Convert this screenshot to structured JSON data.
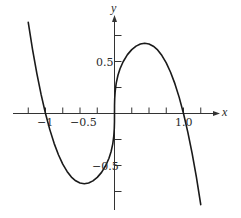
{
  "chart_data": {
    "type": "line",
    "title": "",
    "function": "y = x^(1/3) - x^3",
    "xlabel": "x",
    "ylabel": "y",
    "xlim": [
      -1.25,
      1.25
    ],
    "ylim": [
      -0.9,
      0.9
    ],
    "grid": false,
    "legend": null,
    "x_ticks": [
      -1.25,
      -1.0,
      -0.75,
      -0.5,
      -0.25,
      0.25,
      0.5,
      0.75,
      1.0,
      1.25
    ],
    "y_ticks": [
      -0.75,
      -0.5,
      -0.25,
      0.25,
      0.5,
      0.75
    ],
    "x_tick_labels": [
      {
        "value": -1.0,
        "text": "−1"
      },
      {
        "value": -0.5,
        "text": "−0.5"
      },
      {
        "value": 1.0,
        "text": "1.0"
      }
    ],
    "y_tick_labels": [
      {
        "value": 0.5,
        "text": "0.5"
      },
      {
        "value": -0.5,
        "text": "−0.5"
      }
    ],
    "series": [
      {
        "name": "f(x)",
        "color": "#1a1a1a",
        "points": [
          [
            -1.25,
            0.876
          ],
          [
            -1.1875,
            0.615
          ],
          [
            -1.125,
            0.384
          ],
          [
            -1.0625,
            0.179
          ],
          [
            -1.0,
            0.0
          ],
          [
            -0.9375,
            -0.155
          ],
          [
            -0.875,
            -0.287
          ],
          [
            -0.8125,
            -0.397
          ],
          [
            -0.75,
            -0.487
          ],
          [
            -0.6875,
            -0.557
          ],
          [
            -0.625,
            -0.611
          ],
          [
            -0.5625,
            -0.647
          ],
          [
            -0.5,
            -0.669
          ],
          [
            -0.4375,
            -0.675
          ],
          [
            -0.375,
            -0.668
          ],
          [
            -0.3125,
            -0.648
          ],
          [
            -0.25,
            -0.614
          ],
          [
            -0.1875,
            -0.566
          ],
          [
            -0.125,
            -0.498
          ],
          [
            -0.08,
            -0.43
          ],
          [
            -0.05,
            -0.368
          ],
          [
            -0.025,
            -0.292
          ],
          [
            -0.01,
            -0.215
          ],
          [
            -0.003,
            -0.144
          ],
          [
            -0.0005,
            -0.079
          ],
          [
            0.0,
            0.0
          ],
          [
            0.0005,
            0.079
          ],
          [
            0.003,
            0.144
          ],
          [
            0.01,
            0.215
          ],
          [
            0.025,
            0.292
          ],
          [
            0.05,
            0.368
          ],
          [
            0.08,
            0.43
          ],
          [
            0.125,
            0.498
          ],
          [
            0.1875,
            0.566
          ],
          [
            0.25,
            0.614
          ],
          [
            0.3125,
            0.648
          ],
          [
            0.375,
            0.668
          ],
          [
            0.4375,
            0.675
          ],
          [
            0.5,
            0.669
          ],
          [
            0.5625,
            0.647
          ],
          [
            0.625,
            0.611
          ],
          [
            0.6875,
            0.557
          ],
          [
            0.75,
            0.487
          ],
          [
            0.8125,
            0.397
          ],
          [
            0.875,
            0.287
          ],
          [
            0.9375,
            0.155
          ],
          [
            1.0,
            0.0
          ],
          [
            1.0625,
            -0.179
          ],
          [
            1.125,
            -0.384
          ],
          [
            1.1875,
            -0.615
          ],
          [
            1.25,
            -0.876
          ]
        ]
      }
    ],
    "extrema": {
      "local_max": {
        "x": 0.439,
        "y": 0.675
      },
      "local_min": {
        "x": -0.439,
        "y": -0.675
      }
    }
  },
  "axes": {
    "x_name": "x",
    "y_name": "y"
  },
  "labels": {
    "x_neg1": "−1",
    "x_neg05": "−0.5",
    "x_pos1": "1.0",
    "y_pos05": "0.5",
    "y_neg05": "−0.5"
  }
}
